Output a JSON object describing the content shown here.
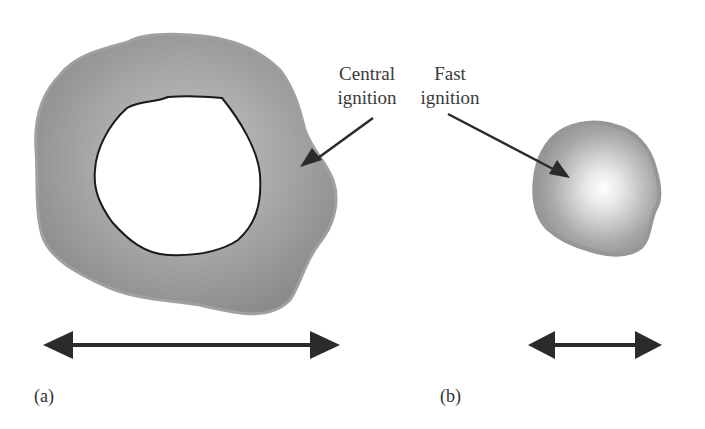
{
  "figure": {
    "labels": {
      "central_line1": "Central",
      "central_line2": "ignition",
      "fast_line1": "Fast",
      "fast_line2": "ignition"
    },
    "panels": {
      "a": "(a)",
      "b": "(b)"
    },
    "colors": {
      "shell_gray": "#8f8f8f",
      "shell_edge": "#a3a3a3",
      "hole_outline": "#1a1a1a",
      "arrow": "#2b2b2b",
      "hotspot": "#ffffff"
    }
  }
}
